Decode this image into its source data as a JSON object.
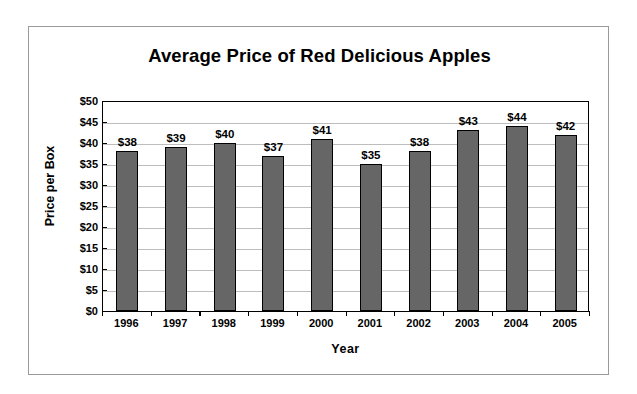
{
  "chart_data": {
    "type": "bar",
    "title": "Average Price of Red Delicious Apples",
    "xlabel": "Year",
    "ylabel": "Price per Box",
    "categories": [
      "1996",
      "1997",
      "1998",
      "1999",
      "2000",
      "2001",
      "2002",
      "2003",
      "2004",
      "2005"
    ],
    "values": [
      38,
      39,
      40,
      37,
      41,
      35,
      38,
      43,
      44,
      42
    ],
    "data_labels": [
      "$38",
      "$39",
      "$40",
      "$37",
      "$41",
      "$35",
      "$38",
      "$43",
      "$44",
      "$42"
    ],
    "ylim": [
      0,
      50
    ],
    "ytick_values": [
      0,
      5,
      10,
      15,
      20,
      25,
      30,
      35,
      40,
      45,
      50
    ],
    "ytick_labels": [
      "$0",
      "$5",
      "$10",
      "$15",
      "$20",
      "$25",
      "$30",
      "$35",
      "$40",
      "$45",
      "$50"
    ],
    "grid": true,
    "legend": "none",
    "bar_color": "#666666",
    "bar_border_color": "#000000",
    "gridline_color": "#bdbdbd",
    "axis_color": "#000000",
    "frame_color": "#9a9a9a",
    "background": "#ffffff"
  }
}
